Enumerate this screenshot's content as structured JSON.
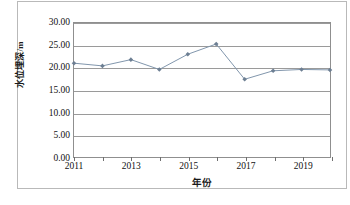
{
  "chart_data": {
    "type": "line",
    "title": "",
    "xlabel": "年份",
    "ylabel": "水位埋深/m",
    "x": [
      2011,
      2012,
      2013,
      2014,
      2015,
      2016,
      2017,
      2018,
      2019,
      2020
    ],
    "categories": [
      "2011",
      "2012",
      "2013",
      "2014",
      "2015",
      "2016",
      "2017",
      "2018",
      "2019",
      "2020"
    ],
    "values": [
      21.0,
      20.4,
      21.8,
      19.6,
      23.0,
      25.3,
      17.4,
      19.3,
      19.6,
      19.5
    ],
    "series": [
      {
        "name": "水位埋深",
        "values": [
          21.0,
          20.4,
          21.8,
          19.6,
          23.0,
          25.3,
          17.4,
          19.3,
          19.6,
          19.5
        ]
      }
    ],
    "ylim": [
      0.0,
      30.0
    ],
    "xlim": [
      2011,
      2020
    ],
    "y_ticks": [
      0.0,
      5.0,
      10.0,
      15.0,
      20.0,
      25.0,
      30.0
    ],
    "y_tick_labels": [
      "0.00",
      "5.00",
      "10.00",
      "15.00",
      "20.00",
      "25.00",
      "30.00"
    ],
    "x_ticks": [
      2011,
      2012,
      2013,
      2014,
      2015,
      2016,
      2017,
      2018,
      2019,
      2020
    ],
    "x_tick_labels": [
      "2011",
      "",
      "2013",
      "",
      "2015",
      "",
      "2017",
      "",
      "2019",
      ""
    ],
    "grid": true,
    "legend": "none",
    "marker": "diamond",
    "line_color": "#8095ab",
    "marker_color": "#6d7f93",
    "grid_color": "#9a9a9a",
    "axis_color": "#8f8f8f"
  },
  "figure": {
    "caption": ""
  }
}
